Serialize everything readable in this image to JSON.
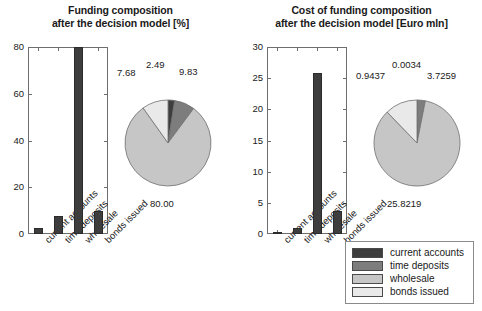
{
  "figure": {
    "background": "#ffffff",
    "palette": {
      "current_accounts": "#3d3d3d",
      "time_deposits": "#7d7d7d",
      "wholesale": "#c6c6c6",
      "bonds_issued": "#e9e9e9"
    }
  },
  "legend": {
    "items": [
      {
        "label": "current accounts",
        "color": "#3d3d3d"
      },
      {
        "label": "time deposits",
        "color": "#7d7d7d"
      },
      {
        "label": "wholesale",
        "color": "#c6c6c6"
      },
      {
        "label": "bonds issued",
        "color": "#e9e9e9"
      }
    ]
  },
  "left": {
    "title_line1": "Funding composition",
    "title_line2": "after the decision model [%]"
  },
  "right": {
    "title_line1": "Cost of funding composition",
    "title_line2": "after the decision model [Euro mln]"
  },
  "chart_data": [
    {
      "type": "bar",
      "id": "funding-composition-bar",
      "title": "Funding composition after the decision model [%]",
      "xlabel": "",
      "ylabel": "",
      "ylim": [
        0,
        80
      ],
      "yticks": [
        "0",
        "20",
        "40",
        "60",
        "80"
      ],
      "ytick_values": [
        0,
        20,
        40,
        60,
        80
      ],
      "grid": false,
      "categories": [
        "current accounts",
        "time deposits",
        "wholesale",
        "bonds issued"
      ],
      "values": [
        2.49,
        7.68,
        80.0,
        9.83
      ],
      "bar_color": "#3d3d3d",
      "note": "wholesale bar is clipped at the top of the axis"
    },
    {
      "type": "pie",
      "id": "funding-composition-pie",
      "title": "Funding composition after the decision model [%]",
      "legend_position": "bottom-right-shared",
      "labels": [
        "current accounts",
        "time deposits",
        "wholesale",
        "bonds issued"
      ],
      "values": [
        2.49,
        7.68,
        80.0,
        9.83
      ],
      "value_labels": [
        "2.49",
        "7.68",
        "80.00",
        "9.83"
      ],
      "colors": [
        "#3d3d3d",
        "#7d7d7d",
        "#c6c6c6",
        "#e9e9e9"
      ]
    },
    {
      "type": "bar",
      "id": "cost-of-funding-bar",
      "title": "Cost of funding composition after the decision model [Euro mln]",
      "xlabel": "",
      "ylabel": "",
      "ylim": [
        0,
        30
      ],
      "yticks": [
        "0",
        "5",
        "10",
        "15",
        "20",
        "25",
        "30"
      ],
      "ytick_values": [
        0,
        5,
        10,
        15,
        20,
        25,
        30
      ],
      "grid": false,
      "categories": [
        "current accounts",
        "time deposits",
        "wholesale",
        "bonds issued"
      ],
      "values": [
        0.0034,
        0.9437,
        25.8219,
        3.7259
      ],
      "bar_color": "#3d3d3d"
    },
    {
      "type": "pie",
      "id": "cost-of-funding-pie",
      "title": "Cost of funding composition after the decision model [Euro mln]",
      "legend_position": "bottom-right-shared",
      "labels": [
        "current accounts",
        "time deposits",
        "wholesale",
        "bonds issued"
      ],
      "values": [
        0.0034,
        0.9437,
        25.8219,
        3.7259
      ],
      "value_labels": [
        "0.0034",
        "0.9437",
        "25.8219",
        "3.7259"
      ],
      "colors": [
        "#3d3d3d",
        "#7d7d7d",
        "#c6c6c6",
        "#e9e9e9"
      ]
    }
  ]
}
